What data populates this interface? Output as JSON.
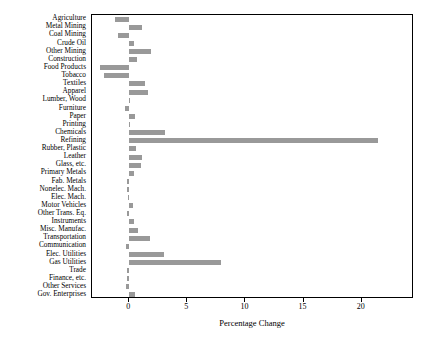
{
  "chart_data": {
    "type": "bar",
    "orientation": "horizontal",
    "title": "",
    "xlabel": "Percentage Change",
    "ylabel": "",
    "xlim": [
      -3.2,
      24.5
    ],
    "xticks": [
      0,
      5,
      10,
      15,
      20
    ],
    "xtick_labels": [
      "0",
      "5",
      "10",
      "15",
      "20"
    ],
    "grid": false,
    "legend": null,
    "bar_color": "#999999",
    "categories": [
      "Agriculture",
      "Metal Mining",
      "Coal Mining",
      "Crude Oil",
      "Other Mining",
      "Construction",
      "Food Products",
      "Tobacco",
      "Textiles",
      "Apparel",
      "Lumber, Wood",
      "Furniture",
      "Paper",
      "Printing",
      "Chemicals",
      "Refining",
      "Rubber, Plastic",
      "Leather",
      "Glass, etc.",
      "Primary Metals",
      "Fab. Metals",
      "Nonelec. Mach.",
      "Elec. Mach.",
      "Motor Vehicles",
      "Other Trans. Eq.",
      "Instruments",
      "Misc. Manufac.",
      "Transportation",
      "Communication",
      "Elec. Utilities",
      "Gas Utilities",
      "Trade",
      "Finance, etc.",
      "Other Services",
      "Gov. Enterprises"
    ],
    "values": [
      -1.2,
      1.1,
      -1.0,
      0.4,
      1.9,
      0.7,
      -2.5,
      -2.2,
      1.4,
      1.6,
      0.1,
      -0.4,
      0.5,
      0.05,
      3.1,
      21.4,
      0.6,
      1.1,
      1.0,
      0.4,
      -0.2,
      -0.15,
      -0.1,
      0.3,
      -0.2,
      0.4,
      0.8,
      1.8,
      -0.3,
      3.0,
      7.9,
      -0.2,
      -0.2,
      -0.3,
      0.5
    ]
  }
}
